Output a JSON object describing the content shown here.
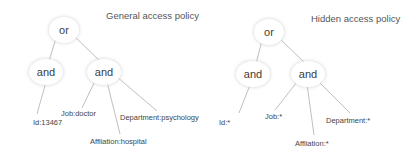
{
  "diagrams": [
    {
      "title": "General access policy",
      "root": "or",
      "and_left": "and",
      "and_right": "and",
      "leaves": {
        "id": "Id:13467",
        "job": "Job:doctor",
        "affiliation": "Affliation:hospital",
        "department": "Department:psychology"
      }
    },
    {
      "title": "Hidden access policy",
      "root": "or",
      "and_left": "and",
      "and_right": "and",
      "leaves": {
        "id": "Id:*",
        "job": "Job:*",
        "affiliation": "Affliation:*",
        "department": "Department:*"
      }
    }
  ],
  "colors": {
    "edge": "#b8b8b8",
    "text": "#444444",
    "background": "#ffffff"
  }
}
